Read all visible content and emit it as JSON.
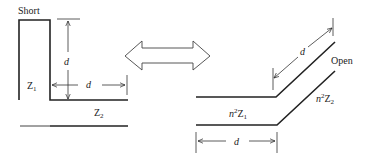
{
  "left_diagram": {
    "short_label": "Short",
    "z1_label": "Z",
    "z1_sub": "1",
    "z2_label": "Z",
    "z2_sub": "2",
    "vertical_dim_label": "d",
    "horizontal_dim_label": "d"
  },
  "equivalence_arrow": {
    "icon": "double-headed-arrow-icon"
  },
  "right_diagram": {
    "open_label": "Open",
    "n2z1_prefix": "n",
    "n2z1_sup": "2",
    "n2z1_label": "Z",
    "n2z1_sub": "1",
    "n2z2_prefix": "n",
    "n2z2_sup": "2",
    "n2z2_label": "Z",
    "n2z2_sub": "2",
    "diagonal_dim_label": "d",
    "horizontal_dim_label": "d"
  },
  "colors": {
    "line": "#222222",
    "background": "#ffffff"
  }
}
